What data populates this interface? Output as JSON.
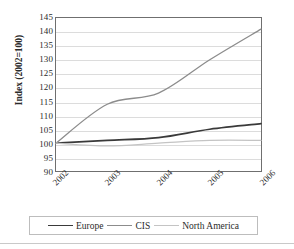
{
  "chart_data": {
    "type": "line",
    "title": "",
    "xlabel": "",
    "ylabel": "Index (2002=100)",
    "categories": [
      "2002",
      "2003",
      "2004",
      "2005",
      "2006"
    ],
    "x": [
      2002,
      2003,
      2004,
      2005,
      2006
    ],
    "ylim": [
      90,
      145
    ],
    "y_ticks": [
      90,
      95,
      100,
      105,
      110,
      115,
      120,
      125,
      130,
      135,
      140,
      145
    ],
    "grid": true,
    "legend_position": "bottom",
    "series": [
      {
        "name": "Europe",
        "color": "#3a3a3a",
        "values": [
          100,
          101,
          102,
          105,
          107
        ]
      },
      {
        "name": "CIS",
        "color": "#8c8c8c",
        "values": [
          100,
          114,
          118,
          130,
          141
        ]
      },
      {
        "name": "North America",
        "color": "#c4c4c4",
        "values": [
          100,
          99,
          100,
          101,
          101
        ]
      }
    ]
  },
  "axes": {
    "y_title": "Index (2002=100)",
    "y_tick_labels": [
      "145",
      "140",
      "135",
      "130",
      "125",
      "120",
      "115",
      "110",
      "105",
      "100",
      "95",
      "90"
    ],
    "x_tick_labels": [
      "2002",
      "2003",
      "2004",
      "2005",
      "2006"
    ]
  },
  "legend": {
    "items": [
      {
        "label": "Europe",
        "color": "#3a3a3a",
        "width": "1.7px"
      },
      {
        "label": "CIS",
        "color": "#8c8c8c",
        "width": "1.4px"
      },
      {
        "label": "North America",
        "color": "#c4c4c4",
        "width": "1.4px"
      }
    ]
  },
  "colors": {
    "frame": "#6f6f6f",
    "gridline": "#dcdcdc",
    "background": "#ffffff",
    "legend_border": "#bdbdbd"
  }
}
